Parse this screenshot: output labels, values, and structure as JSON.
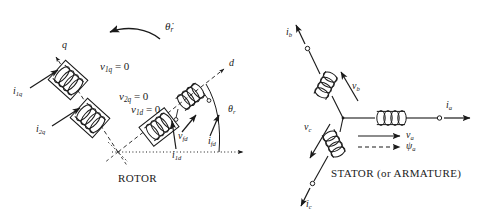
{
  "figure": {
    "type": "winding-diagram"
  },
  "rotor": {
    "caption": "ROTOR",
    "axes": {
      "q_axis_label": "q",
      "d_axis_label": "d",
      "rotor_angle_label": "θ",
      "rotor_angle_sub": "r",
      "rotor_speed_label": "θ̇",
      "rotor_speed_sub": "r"
    },
    "windings": [
      {
        "name": "damper-1q",
        "current_label": "i",
        "current_sub": "1q",
        "voltage_label": "v",
        "voltage_sub": "1q",
        "voltage_value": "= 0"
      },
      {
        "name": "damper-2q",
        "current_label": "i",
        "current_sub": "2q",
        "voltage_label": "v",
        "voltage_sub": "2q",
        "voltage_value": "= 0"
      },
      {
        "name": "damper-1d",
        "current_label": "i",
        "current_sub": "1d",
        "voltage_label": "v",
        "voltage_sub": "1d",
        "voltage_value": "= 0"
      },
      {
        "name": "field-fd",
        "current_label": "i",
        "current_sub": "fd",
        "voltage_label": "v",
        "voltage_sub": "fd",
        "voltage_value": ""
      }
    ]
  },
  "stator": {
    "caption": "STATOR (or ARMATURE)",
    "phases": [
      {
        "name": "phase-a",
        "current_label": "i",
        "current_sub": "a",
        "voltage_label": "v",
        "voltage_sub": "a"
      },
      {
        "name": "phase-b",
        "current_label": "i",
        "current_sub": "b",
        "voltage_label": "v",
        "voltage_sub": "b"
      },
      {
        "name": "phase-c",
        "current_label": "i",
        "current_sub": "c",
        "voltage_label": "v",
        "voltage_sub": "c"
      }
    ],
    "legend": [
      {
        "name": "voltage-legend",
        "style": "solid-arrow",
        "symbol": "v",
        "sub": "a"
      },
      {
        "name": "flux-legend",
        "style": "dashed-arrow",
        "symbol": "ψ",
        "sub": "a"
      }
    ]
  },
  "colors": {
    "ink": "#1a1a1a",
    "background": "#ffffff"
  }
}
